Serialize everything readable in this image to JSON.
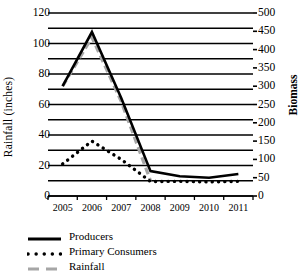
{
  "chart_data": {
    "type": "line",
    "title": "",
    "xlabel": "",
    "ylabel": "Rainfall (inches)",
    "y2label": "Biomass",
    "categories": [
      "2005",
      "2006",
      "2007",
      "2008",
      "2009",
      "2010",
      "2011"
    ],
    "ylim": [
      0,
      120
    ],
    "yticks": [
      0,
      20,
      40,
      60,
      80,
      100,
      120
    ],
    "y2lim": [
      0,
      500
    ],
    "y2ticks": [
      0,
      50,
      100,
      150,
      200,
      250,
      300,
      350,
      400,
      450,
      500
    ],
    "grid": true,
    "legend_position": "bottom-left",
    "series": [
      {
        "name": "Producers",
        "axis": "right",
        "style": "solid",
        "color": "#000000",
        "values_biomass": [
          300,
          448,
          268,
          68,
          54,
          50,
          60
        ],
        "values": [
          72,
          107.5,
          64.3,
          16.3,
          13,
          12,
          14.4
        ]
      },
      {
        "name": "Primary Consumers",
        "axis": "right",
        "style": "dotted",
        "color": "#000000",
        "values_biomass": [
          88,
          150,
          100,
          40,
          40,
          38,
          40
        ],
        "values": [
          21,
          36,
          24,
          9.5,
          9.6,
          9.2,
          9.6
        ]
      },
      {
        "name": "Rainfall",
        "axis": "left",
        "style": "dashed",
        "color": "#a6a6a6",
        "values": [
          72,
          104,
          62,
          10,
          null,
          null,
          null
        ]
      }
    ]
  },
  "axes": {
    "left_ticks": [
      "120",
      "100",
      "80",
      "60",
      "40",
      "20",
      "0"
    ],
    "right_ticks": [
      "500",
      "450",
      "400",
      "350",
      "300",
      "250",
      "200",
      "150",
      "100",
      "50",
      "0"
    ],
    "x_ticks": [
      "2005",
      "2006",
      "2007",
      "2008",
      "2009",
      "2010",
      "2011"
    ],
    "left_title": "Rainfall (inches)",
    "right_title": "Biomass"
  },
  "legend": {
    "items": [
      {
        "label": "Producers",
        "style": "solid",
        "color": "#000000"
      },
      {
        "label": "Primary Consumers",
        "style": "dotted",
        "color": "#000000"
      },
      {
        "label": "Rainfall",
        "style": "dashed",
        "color": "#a6a6a6"
      }
    ]
  }
}
